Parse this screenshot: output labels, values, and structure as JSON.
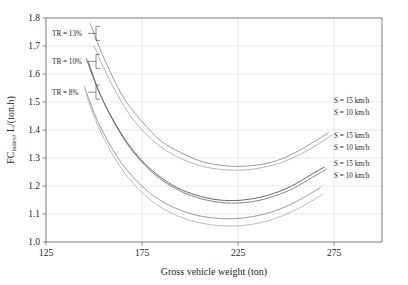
{
  "chart_data": {
    "type": "line",
    "title": "",
    "xlabel": "Gross vehicle weight (ton)",
    "ylabel": "FC_index, L/(ton.h)",
    "ylabel_display": "FC",
    "ylabel_subscript": "index",
    "ylabel_units": ", L/(ton.h)",
    "xlim": [
      125,
      300
    ],
    "ylim": [
      1.0,
      1.8
    ],
    "xticks": [
      125,
      175,
      225,
      275
    ],
    "yticks": [
      1.0,
      1.1,
      1.2,
      1.3,
      1.4,
      1.5,
      1.6,
      1.7,
      1.8
    ],
    "xtick_labels": [
      "125",
      "175",
      "225",
      "275"
    ],
    "ytick_labels": [
      "1.0",
      "1.1",
      "1.2",
      "1.3",
      "1.4",
      "1.5",
      "1.6",
      "1.7",
      "1.8"
    ],
    "grid": true,
    "grid_axis": "both",
    "legend_position": "right-inside",
    "series": [
      {
        "name": "TR = 13%, S = 15 km/h",
        "group": "TR = 13%",
        "speed_label": "S = 15 km/h",
        "color": "#8a8a8a",
        "x": [
          148,
          155,
          165,
          175,
          185,
          195,
          205,
          215,
          225,
          235,
          245,
          255,
          265,
          272
        ],
        "y": [
          1.78,
          1.66,
          1.52,
          1.43,
          1.36,
          1.32,
          1.29,
          1.275,
          1.27,
          1.275,
          1.29,
          1.32,
          1.36,
          1.39
        ]
      },
      {
        "name": "TR = 13%, S = 10 km/h",
        "group": "TR = 13%",
        "speed_label": "S = 10 km/h",
        "color": "#a8a8a8",
        "x": [
          150,
          158,
          168,
          178,
          188,
          198,
          208,
          218,
          228,
          238,
          248,
          258,
          268,
          274
        ],
        "y": [
          1.7,
          1.58,
          1.46,
          1.38,
          1.325,
          1.29,
          1.268,
          1.258,
          1.257,
          1.266,
          1.285,
          1.315,
          1.355,
          1.382
        ]
      },
      {
        "name": "TR = 10%, S = 15 km/h",
        "group": "TR = 10%",
        "speed_label": "S = 15 km/h",
        "color": "#4a4a4a",
        "x": [
          146,
          153,
          163,
          173,
          183,
          193,
          203,
          213,
          223,
          233,
          243,
          253,
          263,
          270
        ],
        "y": [
          1.655,
          1.53,
          1.4,
          1.305,
          1.24,
          1.195,
          1.168,
          1.152,
          1.148,
          1.155,
          1.172,
          1.2,
          1.24,
          1.268
        ]
      },
      {
        "name": "TR = 10%, S = 10 km/h",
        "group": "TR = 10%",
        "speed_label": "S = 10 km/h",
        "color": "#6e6e6e",
        "x": [
          147,
          154,
          164,
          174,
          184,
          194,
          204,
          214,
          224,
          234,
          244,
          254,
          264,
          271
        ],
        "y": [
          1.645,
          1.515,
          1.385,
          1.292,
          1.228,
          1.185,
          1.158,
          1.143,
          1.139,
          1.146,
          1.164,
          1.192,
          1.232,
          1.26
        ]
      },
      {
        "name": "TR = 8%, S = 15 km/h",
        "group": "TR = 8%",
        "speed_label": "S = 15 km/h",
        "color": "#8a8a8a",
        "x": [
          145,
          152,
          162,
          172,
          182,
          192,
          202,
          212,
          222,
          232,
          242,
          252,
          262,
          268
        ],
        "y": [
          1.555,
          1.43,
          1.305,
          1.22,
          1.16,
          1.122,
          1.098,
          1.086,
          1.083,
          1.09,
          1.106,
          1.133,
          1.17,
          1.195
        ]
      },
      {
        "name": "TR = 8%, S = 10 km/h",
        "group": "TR = 8%",
        "speed_label": "S = 10 km/h",
        "color": "#b0b0b0",
        "x": [
          146,
          153,
          163,
          173,
          183,
          193,
          203,
          213,
          223,
          233,
          243,
          253,
          263,
          269
        ],
        "y": [
          1.525,
          1.4,
          1.275,
          1.19,
          1.132,
          1.095,
          1.072,
          1.06,
          1.057,
          1.064,
          1.081,
          1.108,
          1.145,
          1.17
        ]
      }
    ],
    "annotations": [
      {
        "id": "tr13",
        "text": "TR = 13%",
        "value": 13,
        "unit": "%",
        "y_at": 1.745
      },
      {
        "id": "tr10",
        "text": "TR = 10%",
        "value": 10,
        "unit": "%",
        "y_at": 1.645
      },
      {
        "id": "tr8",
        "text": "TR = 8%",
        "value": 8,
        "unit": "%",
        "y_at": 1.535
      }
    ],
    "legend_entries": [
      {
        "text": "S = 15 km/h",
        "speed": 15,
        "unit": "km/h",
        "group": "TR = 13%"
      },
      {
        "text": "S = 10 km/h",
        "speed": 10,
        "unit": "km/h",
        "group": "TR = 13%"
      },
      {
        "text": "S = 15 km/h",
        "speed": 15,
        "unit": "km/h",
        "group": "TR = 10%"
      },
      {
        "text": "S = 10 km/h",
        "speed": 10,
        "unit": "km/h",
        "group": "TR = 10%"
      },
      {
        "text": "S = 15 km/h",
        "speed": 15,
        "unit": "km/h",
        "group": "TR = 8%"
      },
      {
        "text": "S = 10 km/h",
        "speed": 10,
        "unit": "km/h",
        "group": "TR = 8%"
      }
    ]
  },
  "colors": {
    "background": "#ffffff",
    "frame": "#6e6e6e",
    "grid": "#d9d9d9",
    "text": "#231f20"
  }
}
